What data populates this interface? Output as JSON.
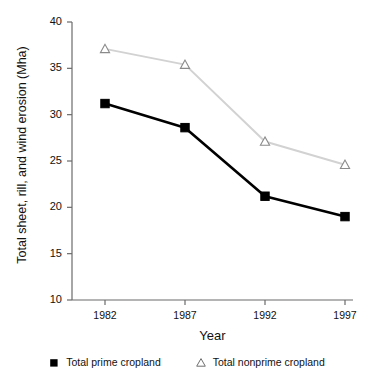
{
  "chart_data": {
    "type": "line",
    "title": "",
    "xlabel": "Year",
    "ylabel": "Total sheet, rill, and wind erosion (Mha)",
    "categories": [
      "1982",
      "1987",
      "1992",
      "1997"
    ],
    "x": [
      1982,
      1987,
      1992,
      1997
    ],
    "xlim": [
      1980,
      1999
    ],
    "ylim": [
      10,
      40
    ],
    "yticks": [
      10,
      15,
      20,
      25,
      30,
      35,
      40
    ],
    "ytick_labels": [
      "10",
      "15",
      "20",
      "25",
      "30",
      "35",
      "40"
    ],
    "xtick_labels": [
      "1982",
      "1987",
      "1992",
      "1997"
    ],
    "grid": false,
    "legend_position": "bottom",
    "series": [
      {
        "name": "Total prime cropland",
        "values": [
          31.2,
          28.6,
          21.2,
          19.0
        ],
        "color": "#000000",
        "marker": "filled-square"
      },
      {
        "name": "Total nonprime cropland",
        "values": [
          37.1,
          35.4,
          27.1,
          24.6
        ],
        "color": "#d2d2d2",
        "marker": "open-triangle"
      }
    ]
  },
  "axes": {
    "y_label": "Total sheet, rill, and wind erosion (Mha)",
    "x_label": "Year",
    "y_ticks": [
      {
        "label": "40"
      },
      {
        "label": "35"
      },
      {
        "label": "30"
      },
      {
        "label": "25"
      },
      {
        "label": "20"
      },
      {
        "label": "15"
      },
      {
        "label": "10"
      }
    ],
    "x_ticks": [
      {
        "label": "1982"
      },
      {
        "label": "1987"
      },
      {
        "label": "1992"
      },
      {
        "label": "1997"
      }
    ]
  },
  "legend": {
    "items": [
      {
        "label": "Total prime cropland",
        "marker": "filled-square-marker",
        "color": "#000000"
      },
      {
        "label": "Total nonprime cropland",
        "marker": "open-triangle-marker",
        "color": "#7a7a7a"
      }
    ]
  }
}
